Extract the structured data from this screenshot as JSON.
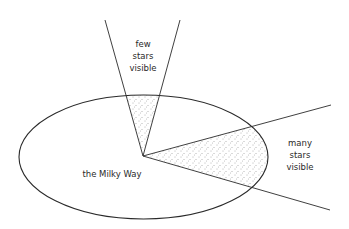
{
  "diagram": {
    "title": "",
    "labels": {
      "galaxy": "the Milky Way",
      "perpendicular": [
        "few",
        "stars",
        "visible"
      ],
      "in_plane": [
        "many",
        "stars",
        "visible"
      ]
    },
    "colors": {
      "line": "#2a2a2a",
      "stipple": "#555555",
      "background": "#ffffff"
    },
    "geometry": {
      "ellipse": {
        "cx": 143.5,
        "cy": 157,
        "rx": 124.5,
        "ry": 62
      },
      "observer": {
        "x": 143,
        "y": 156
      },
      "cone_up": {
        "left_end": [
          105,
          20
        ],
        "right_end": [
          180,
          20
        ]
      },
      "cone_side": {
        "upper_end": [
          331,
          105
        ],
        "lower_end": [
          330,
          210
        ]
      }
    }
  }
}
